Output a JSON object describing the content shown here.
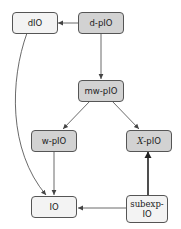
{
  "colors": {
    "shaded_fill": "#d2d2d2",
    "plain_fill": "#f3f3f3",
    "border": "#555555",
    "edge": "#444444"
  },
  "nodes": {
    "dio": {
      "label": "dIO",
      "style": "plain"
    },
    "d_pio": {
      "label": "d-pIO",
      "style": "shaded"
    },
    "mw_pio": {
      "label": "mw-pIO",
      "style": "shaded"
    },
    "w_pio": {
      "label": "w-pIO",
      "style": "shaded"
    },
    "x_pio": {
      "prefix": "X",
      "label": "-pIO",
      "style": "shaded"
    },
    "io": {
      "label": "IO",
      "style": "plain"
    },
    "subexp_io": {
      "line1": "subexp-",
      "line2": "IO",
      "style": "plain"
    }
  },
  "edges": [
    {
      "from": "d-pIO",
      "to": "dIO"
    },
    {
      "from": "d-pIO",
      "to": "mw-pIO"
    },
    {
      "from": "mw-pIO",
      "to": "w-pIO"
    },
    {
      "from": "mw-pIO",
      "to": "X-pIO"
    },
    {
      "from": "dIO",
      "to": "IO",
      "curved": true
    },
    {
      "from": "w-pIO",
      "to": "IO"
    },
    {
      "from": "subexp-IO",
      "to": "IO"
    },
    {
      "from": "subexp-IO",
      "to": "X-pIO",
      "thick": true
    }
  ]
}
